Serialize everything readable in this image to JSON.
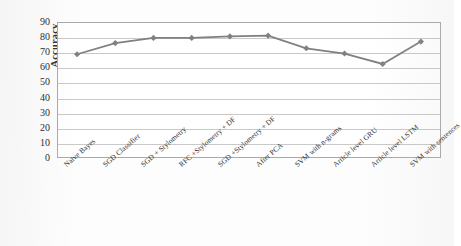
{
  "chart_data": {
    "type": "line",
    "title": "",
    "xlabel": "",
    "ylabel": "Accuracy",
    "ylim": [
      0,
      90
    ],
    "ytick_step": 10,
    "yticks": [
      90,
      80,
      70,
      60,
      50,
      40,
      30,
      20,
      10,
      0
    ],
    "grid": true,
    "legend": "none",
    "marker": "diamond",
    "series_color": "#808080",
    "gridline_color": "#c9c9c9",
    "axis_color": "#a9a9a9",
    "categories": [
      "Naïve Bayes",
      "SGD Classifier",
      "SGD + Stylometry",
      "RFC +Stylometry + DF",
      "SGD +Stylometry + DF",
      "After PCA",
      "SVM with n-grams",
      "Article level GRU",
      "Article level LSTM",
      "SVM with sentences"
    ],
    "series": [
      {
        "name": "Accuracy",
        "values": [
          69,
          76.5,
          80,
          80,
          81,
          81.5,
          73,
          69.5,
          62.5,
          77.5
        ]
      }
    ]
  }
}
